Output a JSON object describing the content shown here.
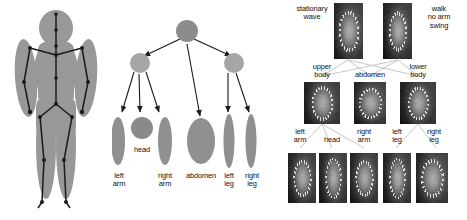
{
  "figure": {
    "background_color": "#ffffff",
    "shape_fill_dark": "#8c8c8c",
    "shape_fill_light": "#a8a8a8",
    "skeleton_color": "#1a1a1a",
    "label_color": "#101010"
  },
  "panel_body": {
    "name": "stick-figure-on-silhouette",
    "description": "Frontal human silhouette with overlaid skeleton of joints and limbs"
  },
  "panel_tree": {
    "name": "body-part-hierarchy-tree",
    "root": {
      "label": "",
      "shape": "circle"
    },
    "level2": [
      {
        "label": "",
        "shape": "circle"
      },
      {
        "label": "",
        "shape": "circle"
      }
    ],
    "leaves": [
      {
        "label": "left\narm",
        "shape": "ellipse"
      },
      {
        "label": "head",
        "shape": "circle"
      },
      {
        "label": "right\narm",
        "shape": "ellipse"
      },
      {
        "label": "abdomen",
        "shape": "ellipse"
      },
      {
        "label": "left\nleg",
        "shape": "ellipse"
      },
      {
        "label": "right\nleg",
        "shape": "ellipse"
      }
    ]
  },
  "panel_grid": {
    "name": "motion-image-hierarchy",
    "rows": [
      {
        "row_index": 0,
        "tiles": [
          {
            "label": "stationary\nwave",
            "label_side": "left"
          },
          {
            "label": "walk\nno arm\nswing",
            "label_side": "right"
          }
        ]
      },
      {
        "row_index": 1,
        "tiles": [
          {
            "label": "upper\nbody",
            "label_side": "above"
          },
          {
            "label": "abdomen",
            "label_side": "above"
          },
          {
            "label": "lower\nbody",
            "label_side": "above"
          }
        ]
      },
      {
        "row_index": 2,
        "tiles": [
          {
            "label": "left\narm",
            "label_side": "above"
          },
          {
            "label": "head",
            "label_side": "above"
          },
          {
            "label": "right\narm",
            "label_side": "above"
          },
          {
            "label": "left\nleg",
            "label_side": "above"
          },
          {
            "label": "right\nleg",
            "label_side": "above"
          }
        ]
      }
    ]
  }
}
